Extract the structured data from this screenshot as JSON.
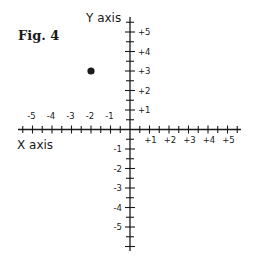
{
  "figure": {
    "title": "Fig. 4",
    "x_axis_label": "X axis",
    "y_axis_label": "Y axis",
    "ink_color": "#1a1a1a",
    "background": "#ffffff"
  },
  "chart_data": {
    "type": "scatter",
    "title": "Fig. 4",
    "xlabel": "X axis",
    "ylabel": "Y axis",
    "xlim": [
      -5.5,
      5.5
    ],
    "ylim": [
      -6,
      5.7
    ],
    "x_tick_labels": [
      "-5",
      "-4",
      "-3",
      "-2",
      "-1",
      "+1",
      "+2",
      "+3",
      "+4",
      "+5"
    ],
    "y_tick_labels": [
      "+5",
      "+4",
      "+3",
      "+2",
      "+1",
      "-1",
      "-2",
      "-3",
      "-4",
      "-5"
    ],
    "minor_ticks": "every 0.5 unit",
    "grid": false,
    "points": [
      {
        "x": -2,
        "y": 3
      }
    ]
  }
}
